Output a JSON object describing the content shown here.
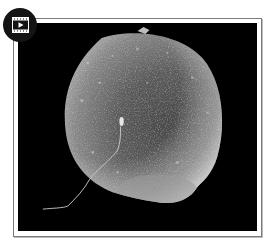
{
  "media": {
    "type": "video",
    "badge_icon": "film-play-icon",
    "subject": "scanning electron micrograph of a sperm cell on the surface of an egg cell",
    "colors": {
      "background": "#000000",
      "frame_border": "#7a7a7a",
      "frame_mat": "#ffffff",
      "badge": "#141414",
      "badge_icon": "#ffffff"
    }
  }
}
